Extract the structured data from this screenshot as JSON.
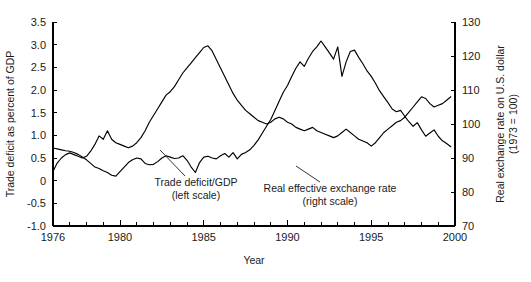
{
  "chart_data": {
    "type": "line",
    "title": "",
    "xlabel": "Year",
    "grid": false,
    "legend_position": "inline-annotations",
    "x_axis": {
      "label": "Year",
      "min": 1976,
      "max": 2000,
      "tick_labels": [
        "1976",
        "1980",
        "1985",
        "1990",
        "1995",
        "2000"
      ],
      "tick_values": [
        1976,
        1980,
        1985,
        1990,
        1995,
        2000
      ],
      "minor_tick_step": 1
    },
    "y_axis_left": {
      "label": "Trade deficit as percent of GDP",
      "min": -1.0,
      "max": 3.5,
      "tick_labels": [
        "3.5",
        "3.0",
        "2.5",
        "2.0",
        "1.5",
        "1.0",
        "0.5",
        "0",
        "-0.5",
        "-1.0"
      ],
      "tick_values": [
        3.5,
        3.0,
        2.5,
        2.0,
        1.5,
        1.0,
        0.5,
        0.0,
        -0.5,
        -1.0
      ]
    },
    "y_axis_right": {
      "label_line1": "Real exchange rate on U.S. dollar",
      "label_line2": "(1973 = 100)",
      "min": 70,
      "max": 130,
      "tick_labels": [
        "130",
        "120",
        "110",
        "100",
        "90",
        "80",
        "70"
      ],
      "tick_values": [
        130,
        120,
        110,
        100,
        90,
        80,
        70
      ]
    },
    "annotations": [
      {
        "id": "trade-deficit-annotation",
        "line1": "Trade deficit/GDP",
        "line2": "(left scale)",
        "text_x": 196,
        "text_y": 186,
        "leader_from_x": 185,
        "leader_from_y": 176,
        "leader_to_x": 160,
        "leader_to_y": 150
      },
      {
        "id": "exchange-rate-annotation",
        "line1": "Real effective exchange rate",
        "line2": "(right scale)",
        "text_x": 330,
        "text_y": 192,
        "leader_from_x": 320,
        "leader_from_y": 182,
        "leader_to_x": 296,
        "leader_to_y": 166
      }
    ],
    "series": [
      {
        "name": "Trade deficit/GDP",
        "axis": "left",
        "units": "percent of GDP",
        "x": [
          1976.0,
          1976.25,
          1976.5,
          1976.75,
          1977.0,
          1977.25,
          1977.5,
          1977.75,
          1978.0,
          1978.25,
          1978.5,
          1978.75,
          1979.0,
          1979.25,
          1979.5,
          1979.75,
          1980.0,
          1980.25,
          1980.5,
          1980.75,
          1981.0,
          1981.25,
          1981.5,
          1981.75,
          1982.0,
          1982.25,
          1982.5,
          1982.75,
          1983.0,
          1983.25,
          1983.5,
          1983.75,
          1984.0,
          1984.25,
          1984.5,
          1984.75,
          1985.0,
          1985.25,
          1985.5,
          1985.75,
          1986.0,
          1986.25,
          1986.5,
          1986.75,
          1987.0,
          1987.25,
          1987.5,
          1987.75,
          1988.0,
          1988.25,
          1988.5,
          1988.75,
          1989.0,
          1989.25,
          1989.5,
          1989.75,
          1990.0,
          1990.25,
          1990.5,
          1990.75,
          1991.0,
          1991.25,
          1991.5,
          1991.75,
          1992.0,
          1992.25,
          1992.5,
          1992.75,
          1993.0,
          1993.25,
          1993.5,
          1993.75,
          1994.0,
          1994.25,
          1994.5,
          1994.75,
          1995.0,
          1995.25,
          1995.5,
          1995.75,
          1996.0,
          1996.25,
          1996.5,
          1996.75,
          1997.0,
          1997.25,
          1997.5,
          1997.75,
          1998.0,
          1998.25,
          1998.5,
          1998.75,
          1999.0,
          1999.25,
          1999.5,
          1999.75
        ],
        "values": [
          0.72,
          0.7,
          0.68,
          0.66,
          0.65,
          0.62,
          0.58,
          0.52,
          0.46,
          0.38,
          0.3,
          0.27,
          0.22,
          0.18,
          0.12,
          0.1,
          0.2,
          0.3,
          0.4,
          0.46,
          0.5,
          0.48,
          0.38,
          0.35,
          0.36,
          0.42,
          0.5,
          0.55,
          0.52,
          0.49,
          0.5,
          0.55,
          0.45,
          0.3,
          0.18,
          0.4,
          0.52,
          0.54,
          0.5,
          0.48,
          0.55,
          0.6,
          0.52,
          0.62,
          0.48,
          0.58,
          0.62,
          0.68,
          0.78,
          0.9,
          1.05,
          1.2,
          1.35,
          1.55,
          1.75,
          1.95,
          2.1,
          2.3,
          2.48,
          2.62,
          2.52,
          2.7,
          2.85,
          2.95,
          3.08,
          2.95,
          2.82,
          2.68,
          2.95,
          2.3,
          2.62,
          2.85,
          2.88,
          2.72,
          2.58,
          2.42,
          2.3,
          2.15,
          1.98,
          1.85,
          1.72,
          1.58,
          1.52,
          1.55,
          1.42,
          1.3,
          1.2,
          1.28,
          1.12,
          0.98,
          1.05,
          1.12,
          0.98,
          0.88,
          0.82,
          0.75
        ]
      },
      {
        "name": "Real effective exchange rate",
        "axis": "right",
        "units": "index (1973 = 100)",
        "x": [
          1976.0,
          1976.25,
          1976.5,
          1976.75,
          1977.0,
          1977.25,
          1977.5,
          1977.75,
          1978.0,
          1978.25,
          1978.5,
          1978.75,
          1979.0,
          1979.25,
          1979.5,
          1979.75,
          1980.0,
          1980.25,
          1980.5,
          1980.75,
          1981.0,
          1981.25,
          1981.5,
          1981.75,
          1982.0,
          1982.25,
          1982.5,
          1982.75,
          1983.0,
          1983.25,
          1983.5,
          1983.75,
          1984.0,
          1984.25,
          1984.5,
          1984.75,
          1985.0,
          1985.25,
          1985.5,
          1985.75,
          1986.0,
          1986.25,
          1986.5,
          1986.75,
          1987.0,
          1987.25,
          1987.5,
          1987.75,
          1988.0,
          1988.25,
          1988.5,
          1988.75,
          1989.0,
          1989.25,
          1989.5,
          1989.75,
          1990.0,
          1990.25,
          1990.5,
          1990.75,
          1991.0,
          1991.25,
          1991.5,
          1991.75,
          1992.0,
          1992.25,
          1992.5,
          1992.75,
          1993.0,
          1993.25,
          1993.5,
          1993.75,
          1994.0,
          1994.25,
          1994.5,
          1994.75,
          1995.0,
          1995.25,
          1995.5,
          1995.75,
          1996.0,
          1996.25,
          1996.5,
          1996.75,
          1997.0,
          1997.25,
          1997.5,
          1997.75,
          1998.0,
          1998.25,
          1998.5,
          1998.75,
          1999.0,
          1999.25,
          1999.5,
          1999.75
        ],
        "values": [
          86.0,
          88.5,
          90.0,
          91.0,
          91.5,
          91.0,
          90.5,
          90.0,
          90.5,
          92.0,
          94.0,
          96.5,
          95.5,
          98.0,
          95.5,
          94.5,
          94.0,
          93.5,
          93.0,
          93.5,
          94.5,
          96.0,
          98.0,
          100.5,
          102.5,
          104.5,
          106.5,
          108.5,
          109.5,
          111.0,
          113.0,
          115.0,
          116.5,
          118.0,
          119.5,
          121.0,
          122.5,
          123.0,
          121.5,
          119.0,
          116.5,
          114.0,
          111.5,
          109.0,
          107.0,
          105.5,
          104.0,
          103.0,
          102.0,
          101.0,
          100.5,
          100.0,
          100.5,
          101.5,
          102.0,
          101.5,
          100.5,
          100.0,
          99.0,
          98.5,
          98.0,
          98.5,
          99.0,
          98.0,
          97.5,
          97.0,
          96.5,
          96.0,
          96.5,
          97.5,
          98.5,
          97.5,
          96.5,
          95.5,
          95.0,
          94.5,
          93.5,
          94.5,
          96.0,
          97.5,
          98.5,
          99.5,
          100.5,
          101.0,
          102.0,
          103.5,
          105.0,
          106.5,
          108.0,
          107.5,
          106.0,
          105.0,
          105.5,
          106.0,
          107.0,
          108.0
        ]
      }
    ]
  },
  "plot_geometry": {
    "left": 53,
    "right": 455,
    "top": 22,
    "bottom": 226
  }
}
